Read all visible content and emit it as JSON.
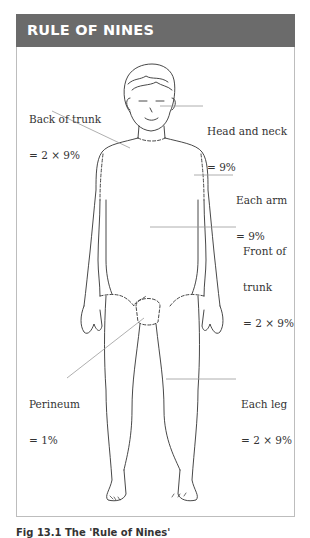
{
  "header": {
    "title": "RULE OF NINES"
  },
  "labels": {
    "back_of_trunk": {
      "line1": "Back of trunk",
      "line2": "= 2 × 9%"
    },
    "head_and_neck": {
      "line1": "Head and neck",
      "line2": "= 9%"
    },
    "each_arm": {
      "line1": "Each arm",
      "line2": "= 9%"
    },
    "front_of_trunk": {
      "line1": "Front of",
      "line2": "trunk",
      "line3": "= 2 × 9%"
    },
    "perineum": {
      "line1": "Perineum",
      "line2": "= 1%"
    },
    "each_leg": {
      "line1": "Each leg",
      "line2": "= 2 × 9%"
    }
  },
  "caption": "Fig 13.1 The 'Rule of Nines'",
  "colors": {
    "header_bg": "#6b6b6b",
    "header_text": "#ffffff",
    "line": "#333333",
    "leader": "#9a9a9a",
    "frame": "#bdbdbd"
  }
}
